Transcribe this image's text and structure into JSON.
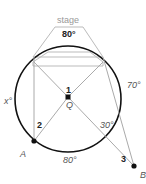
{
  "diagram": {
    "title_label": "stage",
    "arc_labels": {
      "top_arc": "80°",
      "right_arc": "70°",
      "bottom_arc": "80°",
      "left_arc": "x°"
    },
    "angle_labels": {
      "angle_1": "1",
      "angle_2": "2",
      "angle_3": "3",
      "angle_30": "30°"
    },
    "points": {
      "center": "Q",
      "point_a": "A",
      "point_b": "B"
    },
    "colors": {
      "circle": "#111111",
      "chords": "#aaaaaa",
      "stage": "#bbbbbb",
      "labels": "#555555"
    }
  }
}
